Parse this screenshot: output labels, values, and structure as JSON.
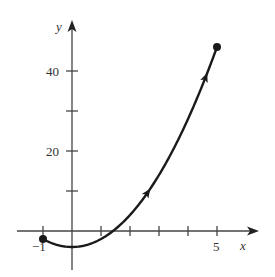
{
  "chart_data": {
    "type": "line",
    "title": "",
    "xlabel": "x",
    "ylabel": "y",
    "xlim": [
      -1.3,
      6.4
    ],
    "ylim": [
      -10,
      52
    ],
    "x_ticks": [
      -1,
      1,
      2,
      3,
      4,
      5
    ],
    "x_tick_labels": {
      "-1": "−1",
      "5": "5"
    },
    "y_ticks": [
      10,
      20,
      30,
      40
    ],
    "y_tick_labels": {
      "20": "20",
      "40": "40"
    },
    "grid": false,
    "legend": null,
    "series": [
      {
        "name": "curve",
        "description": "Oriented parametric curve with direction arrows, from start point (-1,-2) to end point (5,46)",
        "x": [
          -1,
          -0.5,
          0,
          0.5,
          1,
          1.5,
          2,
          2.5,
          3,
          3.5,
          4,
          4.5,
          5
        ],
        "y": [
          -2,
          -3.5,
          -4,
          -3.5,
          -2,
          0.5,
          4,
          8.5,
          14,
          20.5,
          28,
          36.5,
          46
        ],
        "start_point": [
          -1,
          -2
        ],
        "end_point": [
          5,
          46
        ],
        "direction_arrows_at_x": [
          2.6,
          4.6
        ]
      }
    ]
  },
  "labels": {
    "x_axis": "x",
    "y_axis": "y",
    "tick_neg1": "−1",
    "tick_5": "5",
    "tick_20": "20",
    "tick_40": "40"
  },
  "colors": {
    "curve": "#1a1a1a",
    "axis": "#444444"
  }
}
